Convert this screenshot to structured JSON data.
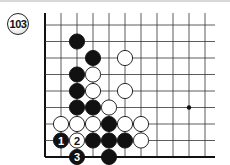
{
  "problem": {
    "number": "103"
  },
  "board": {
    "origin_x": 45,
    "origin_y": 25,
    "dx": 16,
    "dy": 16.5,
    "cols": 11,
    "rows": 9,
    "line_color": "#333333",
    "edge_color": "#111111",
    "star_points": [
      [
        9,
        5
      ]
    ],
    "stones": [
      {
        "c": 2,
        "r": 1,
        "color": "black"
      },
      {
        "c": 3,
        "r": 2,
        "color": "black"
      },
      {
        "c": 5,
        "r": 2,
        "color": "white"
      },
      {
        "c": 2,
        "r": 3,
        "color": "black"
      },
      {
        "c": 3,
        "r": 3,
        "color": "white"
      },
      {
        "c": 2,
        "r": 4,
        "color": "black"
      },
      {
        "c": 3,
        "r": 4,
        "color": "white"
      },
      {
        "c": 5,
        "r": 4,
        "color": "white"
      },
      {
        "c": 2,
        "r": 5,
        "color": "black"
      },
      {
        "c": 3,
        "r": 5,
        "color": "black"
      },
      {
        "c": 4,
        "r": 5,
        "color": "white"
      },
      {
        "c": 1,
        "r": 6,
        "color": "white"
      },
      {
        "c": 2,
        "r": 6,
        "color": "white"
      },
      {
        "c": 3,
        "r": 6,
        "color": "white"
      },
      {
        "c": 4,
        "r": 6,
        "color": "black"
      },
      {
        "c": 5,
        "r": 6,
        "color": "white"
      },
      {
        "c": 6,
        "r": 6,
        "color": "white"
      },
      {
        "c": 1,
        "r": 7,
        "color": "black",
        "label": "1"
      },
      {
        "c": 2,
        "r": 7,
        "color": "white",
        "label": "2"
      },
      {
        "c": 3,
        "r": 7,
        "color": "black"
      },
      {
        "c": 4,
        "r": 7,
        "color": "black"
      },
      {
        "c": 5,
        "r": 7,
        "color": "black"
      },
      {
        "c": 6,
        "r": 7,
        "color": "white"
      },
      {
        "c": 2,
        "r": 8,
        "color": "black",
        "label": "3"
      },
      {
        "c": 4,
        "r": 8,
        "color": "black"
      }
    ]
  }
}
